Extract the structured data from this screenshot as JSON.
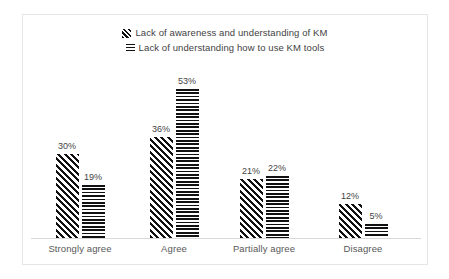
{
  "chart_data": {
    "type": "bar",
    "title": "",
    "subtitle": "",
    "xlabel": "",
    "ylabel": "",
    "grid": false,
    "legend_position": "top-center",
    "value_suffix": "%",
    "ylim": [
      0,
      60
    ],
    "categories": [
      "Strongly agree",
      "Agree",
      "Partially agree",
      "Disagree"
    ],
    "series": [
      {
        "name": "Lack of awareness and understanding of KM",
        "pattern": "diagonal-hatch",
        "color": "#111111",
        "values": [
          30,
          36,
          21,
          12
        ],
        "labels": [
          "30%",
          "36%",
          "21%",
          "12%"
        ]
      },
      {
        "name": "Lack of understanding  how to use KM tools",
        "pattern": "horizontal-stripes",
        "color": "#111111",
        "values": [
          19,
          53,
          22,
          5
        ],
        "labels": [
          "19%",
          "53%",
          "22%",
          "5%"
        ]
      }
    ]
  },
  "legend": {
    "items": [
      {
        "label": "Lack of awareness and understanding of KM",
        "swatch": "diagonal-hatch-swatch"
      },
      {
        "label": "Lack of understanding  how to use KM tools",
        "swatch": "horizontal-stripes-swatch"
      }
    ]
  },
  "style": {
    "frame_border_color": "#e6e6e6",
    "axis_line_color": "#d9d9d9",
    "text_color": "#3f3f3f",
    "category_text_color": "#585858",
    "background": "#ffffff"
  }
}
